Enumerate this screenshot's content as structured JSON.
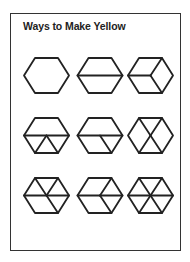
{
  "title": "Ways to Make Yellow",
  "colors": {
    "stroke": "#222222",
    "border": "#333333",
    "background": "#ffffff"
  },
  "grid": {
    "columns": 3,
    "rows": 3,
    "column_centers_x": [
      46.5,
      100,
      150.5
    ],
    "row_centers_y": [
      75.5,
      135.5,
      195.5
    ],
    "hex_half_width": 22.5,
    "hex_half_height": 17.5,
    "hex_top_half_width": 11.5
  },
  "hexagons": [
    {
      "row": 0,
      "col": 0,
      "description": "whole hexagon",
      "lines": []
    },
    {
      "row": 0,
      "col": 1,
      "description": "two trapezoids",
      "lines": [
        [
          "L",
          "R"
        ]
      ]
    },
    {
      "row": 0,
      "col": 2,
      "description": "three rhombuses",
      "lines": [
        [
          "C",
          "L"
        ],
        [
          "C",
          "TR"
        ],
        [
          "C",
          "BR"
        ]
      ]
    },
    {
      "row": 1,
      "col": 0,
      "description": "trapezoid and three triangles",
      "lines": [
        [
          "L",
          "R"
        ],
        [
          "C",
          "BL"
        ],
        [
          "C",
          "BR"
        ]
      ]
    },
    {
      "row": 1,
      "col": 1,
      "description": "trapezoid, rhombus and triangle",
      "lines": [
        [
          "L",
          "R"
        ],
        [
          "C",
          "BR"
        ]
      ]
    },
    {
      "row": 1,
      "col": 2,
      "description": "two rhombuses and two triangles",
      "lines": [
        [
          "C",
          "TL"
        ],
        [
          "C",
          "TR"
        ],
        [
          "C",
          "BL"
        ],
        [
          "C",
          "BR"
        ]
      ]
    },
    {
      "row": 2,
      "col": 0,
      "description": "four triangles and a rhombus",
      "lines": [
        [
          "C",
          "TL"
        ],
        [
          "C",
          "TR"
        ],
        [
          "C",
          "L"
        ],
        [
          "C",
          "R"
        ],
        [
          "C",
          "BR"
        ]
      ]
    },
    {
      "row": 2,
      "col": 1,
      "description": "two rhombuses and two triangles",
      "lines": [
        [
          "C",
          "TR"
        ],
        [
          "C",
          "L"
        ],
        [
          "C",
          "R"
        ],
        [
          "C",
          "BR"
        ]
      ]
    },
    {
      "row": 2,
      "col": 2,
      "description": "six triangles",
      "lines": [
        [
          "C",
          "TL"
        ],
        [
          "C",
          "TR"
        ],
        [
          "C",
          "L"
        ],
        [
          "C",
          "R"
        ],
        [
          "C",
          "BL"
        ],
        [
          "C",
          "BR"
        ]
      ]
    }
  ]
}
